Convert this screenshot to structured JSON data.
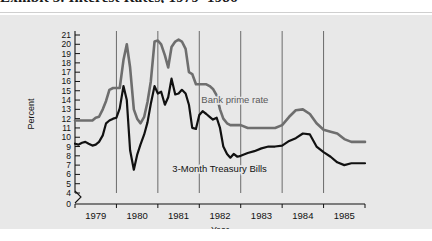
{
  "caption": {
    "text": "Exhibit 5. Interest Rates, 1979–1986"
  },
  "chart_data": {
    "type": "line",
    "title": "",
    "xlabel": "Year",
    "ylabel": "Percent",
    "grid": "vertical-gridlines-at-year-boundaries",
    "legend": "inline-labels",
    "xlim": [
      1979,
      1986
    ],
    "ylim": [
      4,
      21
    ],
    "y_axis_break_below": 4,
    "ytick_labels": [
      "0",
      "4",
      "5",
      "6",
      "7",
      "8",
      "9",
      "10",
      "11",
      "12",
      "13",
      "14",
      "15",
      "16",
      "17",
      "18",
      "19",
      "20",
      "21"
    ],
    "ytick_values": [
      0,
      4,
      5,
      6,
      7,
      8,
      9,
      10,
      11,
      12,
      13,
      14,
      15,
      16,
      17,
      18,
      19,
      20,
      21
    ],
    "xtick_labels": [
      "1979",
      "1980",
      "1981",
      "1982",
      "1983",
      "1984",
      "1985"
    ],
    "xtick_values": [
      1979.5,
      1980.5,
      1981.5,
      1982.5,
      1983.5,
      1984.5,
      1985.5
    ],
    "gridline_values": [
      1980,
      1981,
      1982,
      1983,
      1984,
      1985
    ],
    "series": [
      {
        "name": "Bank prime rate",
        "color": "#6e6e6e",
        "label_x": 1982.05,
        "label_y": 13.7,
        "x": [
          1979.0,
          1979.08,
          1979.17,
          1979.25,
          1979.33,
          1979.42,
          1979.5,
          1979.58,
          1979.67,
          1979.75,
          1979.83,
          1979.92,
          1980.0,
          1980.08,
          1980.17,
          1980.25,
          1980.33,
          1980.42,
          1980.5,
          1980.58,
          1980.67,
          1980.75,
          1980.83,
          1980.92,
          1981.0,
          1981.08,
          1981.17,
          1981.25,
          1981.33,
          1981.42,
          1981.5,
          1981.58,
          1981.67,
          1981.75,
          1981.83,
          1981.92,
          1982.0,
          1982.08,
          1982.17,
          1982.25,
          1982.33,
          1982.42,
          1982.5,
          1982.58,
          1982.67,
          1982.75,
          1982.83,
          1982.92,
          1983.0,
          1983.17,
          1983.33,
          1983.5,
          1983.67,
          1983.83,
          1984.0,
          1984.17,
          1984.33,
          1984.5,
          1984.67,
          1984.83,
          1985.0,
          1985.17,
          1985.33,
          1985.5,
          1985.67,
          1985.83,
          1986.0
        ],
        "values": [
          11.8,
          11.8,
          11.8,
          11.8,
          11.8,
          11.8,
          12.1,
          12.2,
          13.0,
          13.9,
          15.1,
          15.3,
          15.3,
          15.3,
          18.3,
          20.0,
          17.5,
          13.0,
          12.0,
          11.5,
          12.2,
          13.8,
          16.0,
          20.3,
          20.4,
          20.0,
          18.8,
          17.5,
          19.7,
          20.3,
          20.5,
          20.3,
          19.5,
          17.0,
          16.8,
          15.7,
          15.7,
          15.7,
          15.7,
          15.5,
          15.2,
          14.5,
          13.0,
          12.0,
          11.5,
          11.3,
          11.3,
          11.3,
          11.3,
          11.0,
          11.0,
          11.0,
          11.0,
          11.0,
          11.3,
          12.2,
          12.9,
          13.0,
          12.5,
          11.5,
          10.8,
          10.6,
          10.4,
          9.8,
          9.5,
          9.5,
          9.5
        ]
      },
      {
        "name": "3-Month Treasury Bills",
        "color": "#111111",
        "label_x": 1981.35,
        "label_y": 6.3,
        "x": [
          1979.0,
          1979.08,
          1979.17,
          1979.25,
          1979.33,
          1979.42,
          1979.5,
          1979.58,
          1979.67,
          1979.75,
          1979.83,
          1979.92,
          1980.0,
          1980.08,
          1980.17,
          1980.25,
          1980.33,
          1980.42,
          1980.5,
          1980.58,
          1980.67,
          1980.75,
          1980.83,
          1980.92,
          1981.0,
          1981.08,
          1981.17,
          1981.25,
          1981.33,
          1981.42,
          1981.5,
          1981.58,
          1981.67,
          1981.75,
          1981.83,
          1981.92,
          1982.0,
          1982.08,
          1982.17,
          1982.25,
          1982.33,
          1982.42,
          1982.5,
          1982.58,
          1982.67,
          1982.75,
          1982.83,
          1982.92,
          1983.0,
          1983.17,
          1983.33,
          1983.5,
          1983.67,
          1983.83,
          1984.0,
          1984.17,
          1984.33,
          1984.5,
          1984.67,
          1984.83,
          1985.0,
          1985.17,
          1985.33,
          1985.5,
          1985.67,
          1985.83,
          1986.0
        ],
        "values": [
          9.3,
          9.2,
          9.4,
          9.5,
          9.3,
          9.1,
          9.2,
          9.5,
          10.2,
          11.5,
          11.8,
          12.0,
          12.1,
          13.1,
          15.5,
          14.0,
          8.6,
          6.5,
          8.1,
          9.2,
          10.3,
          11.6,
          13.6,
          15.5,
          14.7,
          14.9,
          13.5,
          14.3,
          16.3,
          14.6,
          14.7,
          15.1,
          14.7,
          13.5,
          11.0,
          10.9,
          12.4,
          12.8,
          12.5,
          12.2,
          11.9,
          12.1,
          11.0,
          9.0,
          8.2,
          7.8,
          8.2,
          7.9,
          8.0,
          8.3,
          8.5,
          8.8,
          9.0,
          9.0,
          9.1,
          9.6,
          9.9,
          10.4,
          10.3,
          9.0,
          8.4,
          7.9,
          7.3,
          7.0,
          7.2,
          7.2,
          7.2
        ]
      }
    ]
  }
}
